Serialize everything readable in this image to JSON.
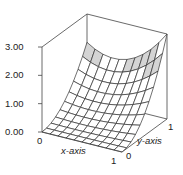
{
  "chart_data": {
    "type": "surface3d",
    "title": "",
    "xlabel": "x-axis",
    "ylabel": "y-axis",
    "zlabel": "",
    "xlim": [
      0,
      1
    ],
    "ylim": [
      0,
      1
    ],
    "zlim": [
      0,
      3
    ],
    "x_ticks": [
      "0",
      "1"
    ],
    "y_ticks": [
      "0",
      "1"
    ],
    "z_ticks": [
      "0.00",
      "1.00",
      "2.00",
      "3.00"
    ],
    "z_tick_values": [
      0,
      1,
      2,
      3
    ],
    "grid_resolution": [
      10,
      10
    ],
    "function_description": "z = y^2 * (2 - 2x + 3x^2); z(0,0)=0, z(1,0)=0, z(0,1)=2, z(1,1)=3, sagging along back edge",
    "corner_values": {
      "x0_y0": 0.0,
      "x1_y0": 0.0,
      "x0_y1": 2.0,
      "x1_y1": 3.0
    },
    "shading": {
      "highlight_band_z": [
        1.6,
        2.4
      ],
      "highlight_color": "#d4d4d4",
      "face_color": "#ffffff",
      "line_color": "#333333"
    },
    "box": true,
    "grid": false,
    "legend": "none"
  },
  "labels": {
    "z3": "3.00",
    "z2": "2.00",
    "z1": "1.00",
    "z0": "0.00",
    "x0": "0",
    "x1": "1",
    "xaxis": "x-axis",
    "y0": "0",
    "y1": "1",
    "yaxis": "y-axis"
  }
}
